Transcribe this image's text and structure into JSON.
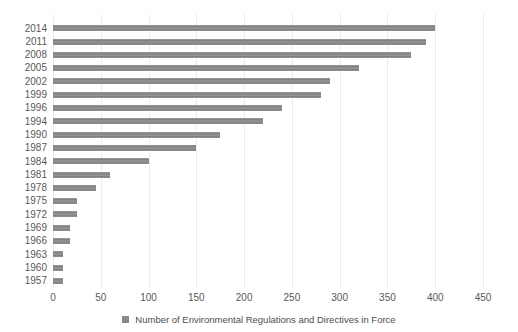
{
  "chart_data": {
    "type": "bar",
    "orientation": "horizontal",
    "title": "",
    "categories": [
      "2014",
      "2011",
      "2008",
      "2005",
      "2002",
      "1999",
      "1996",
      "1994",
      "1990",
      "1987",
      "1984",
      "1981",
      "1978",
      "1975",
      "1972",
      "1969",
      "1966",
      "1963",
      "1960",
      "1957"
    ],
    "values": [
      400,
      390,
      375,
      320,
      290,
      280,
      240,
      220,
      175,
      150,
      100,
      60,
      45,
      25,
      25,
      18,
      18,
      10,
      10,
      10
    ],
    "series_name": "Number of Environmental Regulations and Directives in Force",
    "xlabel": "",
    "ylabel": "",
    "xlim": [
      0,
      450
    ],
    "xticks": [
      0,
      50,
      100,
      150,
      200,
      250,
      300,
      350,
      400,
      450
    ],
    "grid": "vertical",
    "legend": [
      "Number of Environmental Regulations and Directives in Force"
    ],
    "legend_position": "bottom",
    "legend_marker": "square-icon",
    "colors": {
      "bar": "#8a8a8a",
      "gridline": "#ebebeb",
      "tick_text": "#595959",
      "legend_text": "#4d4d4d",
      "background": "#ffffff"
    }
  }
}
